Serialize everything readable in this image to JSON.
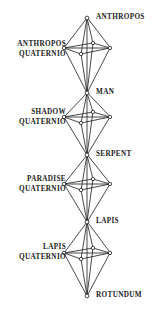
{
  "diagram": {
    "node_labels": [
      {
        "id": "anthropos",
        "text": "ANTHROPOS",
        "side": "right",
        "x": 96,
        "y": 13
      },
      {
        "id": "man",
        "text": "MAN",
        "side": "right",
        "x": 96,
        "y": 88
      },
      {
        "id": "serpent",
        "text": "SERPENT",
        "side": "right",
        "x": 96,
        "y": 150
      },
      {
        "id": "lapis",
        "text": "LAPIS",
        "side": "right",
        "x": 96,
        "y": 217
      },
      {
        "id": "rotundum",
        "text": "ROTUNDUM",
        "side": "right",
        "x": 96,
        "y": 291
      }
    ],
    "group_labels": [
      {
        "id": "anthropos-quaternio",
        "line1": "ANTHROPOS",
        "line2": "QUATERNIO",
        "right": 95,
        "y": 40
      },
      {
        "id": "shadow-quaternio",
        "line1": "SHADOW",
        "line2": "QUATERNIO",
        "right": 95,
        "y": 108
      },
      {
        "id": "paradise-quaternio",
        "line1": "PARADISE",
        "line2": "QUATERNIO",
        "right": 95,
        "y": 175
      },
      {
        "id": "lapis-quaternio",
        "line1": "LAPIS",
        "line2": "QUATERNIO",
        "right": 95,
        "y": 243
      }
    ],
    "colors": {
      "ink": "#1a1a1a",
      "background": "#ffffff",
      "node_fill": "#ffffff"
    },
    "octahedra": [
      {
        "id": "anthropos-quaternio-shape",
        "top_y": 18,
        "bottom_y": 93,
        "mid_y": 48,
        "left_x": 64,
        "right_x": 110,
        "axis_x": 87,
        "inner_y": 54,
        "inner_x": 81
      },
      {
        "id": "shadow-quaternio-shape",
        "top_y": 93,
        "bottom_y": 155,
        "mid_y": 117,
        "left_x": 64,
        "right_x": 110,
        "axis_x": 87,
        "inner_y": 123,
        "inner_x": 81
      },
      {
        "id": "paradise-quaternio-shape",
        "top_y": 155,
        "bottom_y": 222,
        "mid_y": 184,
        "left_x": 64,
        "right_x": 110,
        "axis_x": 87,
        "inner_y": 190,
        "inner_x": 81
      },
      {
        "id": "lapis-quaternio-shape",
        "top_y": 222,
        "bottom_y": 296,
        "mid_y": 253,
        "left_x": 64,
        "right_x": 110,
        "axis_x": 87,
        "inner_y": 259,
        "inner_x": 81
      }
    ]
  }
}
